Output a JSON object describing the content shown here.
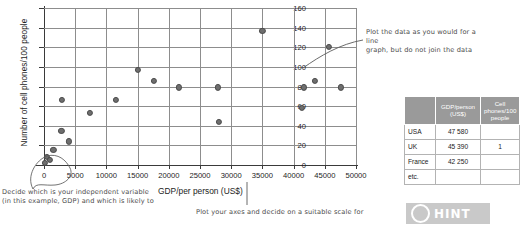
{
  "chart_data": {
    "type": "scatter",
    "title": "",
    "xlabel": "GDP/per person (US$)",
    "ylabel": "Number of cell phones/100 people",
    "xlim": [
      0,
      50000
    ],
    "ylim": [
      0,
      160
    ],
    "xticks": [
      "0",
      "5000",
      "10000",
      "15000",
      "20000",
      "25000",
      "30000",
      "35000",
      "40000",
      "45000",
      "50000"
    ],
    "yticks": [
      "0",
      "20",
      "40",
      "60",
      "80",
      "100",
      "120",
      "140",
      "160"
    ],
    "grid": true,
    "legend": "none",
    "points": [
      {
        "x": 200,
        "y": 2
      },
      {
        "x": 500,
        "y": 8
      },
      {
        "x": 900,
        "y": 5
      },
      {
        "x": 1500,
        "y": 15
      },
      {
        "x": 2800,
        "y": 35
      },
      {
        "x": 4000,
        "y": 24
      },
      {
        "x": 2900,
        "y": 66
      },
      {
        "x": 7300,
        "y": 53
      },
      {
        "x": 11500,
        "y": 66
      },
      {
        "x": 15000,
        "y": 97
      },
      {
        "x": 17600,
        "y": 86
      },
      {
        "x": 21600,
        "y": 79
      },
      {
        "x": 28000,
        "y": 44
      },
      {
        "x": 27900,
        "y": 79
      },
      {
        "x": 35000,
        "y": 137
      },
      {
        "x": 41300,
        "y": 58
      },
      {
        "x": 41700,
        "y": 79
      },
      {
        "x": 43400,
        "y": 86
      },
      {
        "x": 45600,
        "y": 120
      },
      {
        "x": 47600,
        "y": 79
      }
    ]
  },
  "annotations": {
    "right": "Plot the data as you would for a line\ngraph, but do not join the data",
    "left": "Decide which is your independent variable\n(in this example, GDP) and which is likely to",
    "bottom": "Plot your axes and decide on a suitable scale for"
  },
  "table": {
    "headers": [
      "",
      "GDP/person (US$)",
      "Cell phones/100 people"
    ],
    "rows": [
      {
        "country": "USA",
        "gdp": "47 580",
        "phones": ""
      },
      {
        "country": "UK",
        "gdp": "45 390",
        "phones": "1"
      },
      {
        "country": "France",
        "gdp": "42 250",
        "phones": ""
      },
      {
        "country": "etc.",
        "gdp": "",
        "phones": ""
      }
    ]
  },
  "hint": {
    "label": "HINT",
    "icon": "circle-icon",
    "background": "#c9c9c9"
  },
  "colors": {
    "point": "#6e6e6e",
    "grid": "#8d8d8d",
    "axis": "#3a3a3a",
    "table_header": "#9a9a9a"
  }
}
